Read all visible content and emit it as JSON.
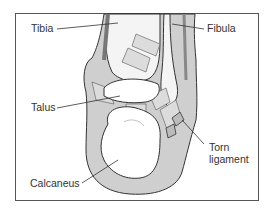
{
  "diagram": {
    "labels": {
      "tibia": "Tibia",
      "fibula": "Fibula",
      "talus": "Talus",
      "torn_ligament_line1": "Torn",
      "torn_ligament_line2": "ligament",
      "calcaneus": "Calcaneus"
    },
    "colors": {
      "frame": "#555555",
      "bone_fill": "#ffffff",
      "soft_tissue": "#c8c8c8",
      "outline": "#333333",
      "text": "#333333"
    }
  }
}
